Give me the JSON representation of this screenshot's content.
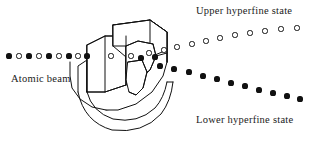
{
  "figure": {
    "background_color": "#ffffff",
    "ink_color": "#111111",
    "width": 309,
    "height": 151
  },
  "labels": {
    "upper_state": "Upper hyperfine state",
    "lower_state": "Lower hyperfine state",
    "atomic_beam": "Atomic beam"
  },
  "apparatus": {
    "name": "c-shaped-deflecting-magnet",
    "description": "Three-dimensional C-shaped magnet with rectangular pole piece block and rounded yoke"
  },
  "chart_data": {
    "type": "scatter",
    "xlabel": "",
    "ylabel": "",
    "xlim": [
      0,
      309
    ],
    "ylim": [
      151,
      0
    ],
    "grid": false,
    "legend": "inline annotations",
    "annotations": [
      {
        "text": "Upper hyperfine state",
        "x": 196,
        "y": 6
      },
      {
        "text": "Lower hyperfine state",
        "x": 196,
        "y": 115
      },
      {
        "text": "Atomic beam",
        "x": 11,
        "y": 74
      }
    ],
    "series": [
      {
        "name": "incident-beam",
        "marker": "alternating filled and open circles",
        "size": 5.2,
        "points": [
          {
            "x": 9,
            "y": 56,
            "style": "filled"
          },
          {
            "x": 19,
            "y": 56,
            "style": "open"
          },
          {
            "x": 29,
            "y": 56,
            "style": "filled"
          },
          {
            "x": 39,
            "y": 56,
            "style": "open"
          },
          {
            "x": 49,
            "y": 56,
            "style": "filled"
          },
          {
            "x": 59,
            "y": 56,
            "style": "open"
          },
          {
            "x": 69,
            "y": 56,
            "style": "filled"
          },
          {
            "x": 78,
            "y": 56,
            "style": "open"
          },
          {
            "x": 87,
            "y": 56,
            "style": "filled"
          }
        ]
      },
      {
        "name": "beam-inside-magnet",
        "marker": "alternating filled and open circles",
        "size": 5.2,
        "points": [
          {
            "x": 111,
            "y": 56,
            "style": "open"
          },
          {
            "x": 131,
            "y": 56,
            "style": "open"
          },
          {
            "x": 141,
            "y": 58,
            "style": "filled"
          },
          {
            "x": 155,
            "y": 57,
            "style": "filled"
          }
        ]
      },
      {
        "name": "upper-hyperfine-state",
        "marker": "open circles",
        "size": 5.2,
        "points": [
          {
            "x": 149,
            "y": 53
          },
          {
            "x": 164,
            "y": 50
          },
          {
            "x": 177,
            "y": 47
          },
          {
            "x": 192,
            "y": 44
          },
          {
            "x": 206,
            "y": 41
          },
          {
            "x": 220,
            "y": 38
          },
          {
            "x": 235,
            "y": 35
          },
          {
            "x": 250,
            "y": 33
          },
          {
            "x": 265,
            "y": 31
          },
          {
            "x": 281,
            "y": 29
          },
          {
            "x": 297,
            "y": 28
          }
        ]
      },
      {
        "name": "lower-hyperfine-state",
        "marker": "filled circles",
        "size": 5.2,
        "points": [
          {
            "x": 160,
            "y": 66
          },
          {
            "x": 174,
            "y": 69
          },
          {
            "x": 189,
            "y": 72
          },
          {
            "x": 203,
            "y": 76
          },
          {
            "x": 217,
            "y": 79
          },
          {
            "x": 231,
            "y": 83
          },
          {
            "x": 245,
            "y": 86
          },
          {
            "x": 259,
            "y": 90
          },
          {
            "x": 273,
            "y": 93
          },
          {
            "x": 287,
            "y": 96
          },
          {
            "x": 300,
            "y": 99
          }
        ]
      }
    ]
  }
}
